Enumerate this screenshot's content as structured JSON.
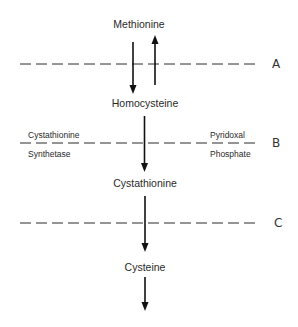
{
  "diagram": {
    "nodes": [
      {
        "id": "methionine",
        "label": "Methionine"
      },
      {
        "id": "homocysteine",
        "label": "Homocysteine"
      },
      {
        "id": "cystathionine",
        "label": "Cystathionine"
      },
      {
        "id": "cysteine",
        "label": "Cysteine"
      }
    ],
    "edges": [
      {
        "from": "methionine",
        "to": "homocysteine",
        "direction": "down"
      },
      {
        "from": "homocysteine",
        "to": "methionine",
        "direction": "up"
      },
      {
        "from": "homocysteine",
        "to": "cystathionine",
        "direction": "down"
      },
      {
        "from": "cystathionine",
        "to": "cysteine",
        "direction": "down"
      },
      {
        "from": "cysteine",
        "to": "",
        "direction": "down"
      }
    ],
    "blocks": [
      {
        "id": "A",
        "label": "A"
      },
      {
        "id": "B",
        "label": "B",
        "enzyme_line1": "Cystathionine",
        "enzyme_line2": "Synthetase",
        "cofactor_line1": "Pyridoxal",
        "cofactor_line2": "Phosphate"
      },
      {
        "id": "C",
        "label": "C"
      }
    ],
    "colors": {
      "ink": "#111111",
      "text": "#2a2a2a",
      "background": "#ffffff"
    }
  }
}
